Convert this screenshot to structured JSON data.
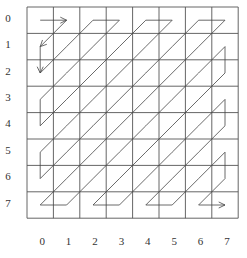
{
  "diagram": {
    "type": "zigzag-scan",
    "grid_size": 8,
    "row_labels": [
      "0",
      "1",
      "2",
      "3",
      "4",
      "5",
      "6",
      "7"
    ],
    "col_labels": [
      "0",
      "1",
      "2",
      "3",
      "4",
      "5",
      "6",
      "7"
    ],
    "colors": {
      "grid": "#555555",
      "path": "#444444",
      "text": "#333333"
    }
  }
}
